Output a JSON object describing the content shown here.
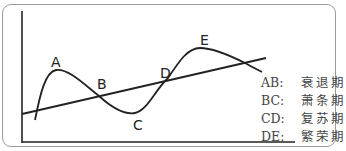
{
  "diagram": {
    "title": "",
    "points": [
      {
        "id": "A",
        "label": "A"
      },
      {
        "id": "B",
        "label": "B"
      },
      {
        "id": "C",
        "label": "C"
      },
      {
        "id": "D",
        "label": "D"
      },
      {
        "id": "E",
        "label": "E"
      }
    ],
    "legend": [
      {
        "key": "AB:",
        "value": "衰退期"
      },
      {
        "key": "BC:",
        "value": "萧条期"
      },
      {
        "key": "CD:",
        "value": "复苏期"
      },
      {
        "key": "DE:",
        "value": "繁荣期"
      }
    ],
    "colors": {
      "line": "#222222",
      "frame": "#9a9a9a",
      "text": "#444444"
    }
  }
}
